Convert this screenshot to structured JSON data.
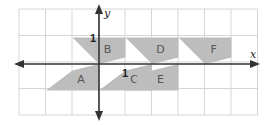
{
  "diagram": {
    "type": "coordinate-grid-with-shapes",
    "grid": {
      "columns": 9,
      "rows": 4,
      "line_color": "#d6d6d6",
      "background": "#ffffff"
    },
    "axes": {
      "x_label": "x",
      "y_label": "y",
      "x_tick_label": "1",
      "y_tick_label": "1",
      "color": "#333333"
    },
    "shape_fill": "#bdbdbd",
    "shapes": [
      {
        "label": "A",
        "points": [
          [
            -2,
            -1
          ],
          [
            0,
            -1
          ],
          [
            0,
            0
          ],
          [
            -1,
            -0.25
          ]
        ]
      },
      {
        "label": "B",
        "points": [
          [
            -1,
            1
          ],
          [
            1,
            1
          ],
          [
            1,
            0.25
          ],
          [
            0,
            0
          ]
        ]
      },
      {
        "label": "C",
        "points": [
          [
            0,
            -1
          ],
          [
            2,
            -1
          ],
          [
            2,
            0
          ],
          [
            1,
            -0.25
          ]
        ]
      },
      {
        "label": "D",
        "points": [
          [
            1,
            1
          ],
          [
            3,
            1
          ],
          [
            3,
            0.25
          ],
          [
            2,
            0
          ]
        ]
      },
      {
        "label": "E",
        "points": [
          [
            1,
            -1
          ],
          [
            3,
            -1
          ],
          [
            3,
            0
          ],
          [
            2,
            -0.25
          ]
        ]
      },
      {
        "label": "F",
        "points": [
          [
            3,
            1
          ],
          [
            5,
            1
          ],
          [
            5,
            0.25
          ],
          [
            4,
            0
          ]
        ]
      }
    ]
  }
}
